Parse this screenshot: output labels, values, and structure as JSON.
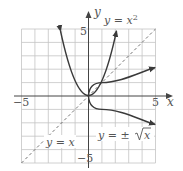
{
  "figure": {
    "x_axis_label": "x",
    "y_axis_label": "y",
    "x_min_tick": "−5",
    "x_max_tick": "5",
    "y_max_tick": "5",
    "y_min_tick": "−5",
    "curves": [
      {
        "name": "parabola",
        "label": "y = x²",
        "style": "solid"
      },
      {
        "name": "sqrt",
        "label": "y = ±√x",
        "style": "solid"
      },
      {
        "name": "identity",
        "label": "y = x",
        "style": "dashed"
      }
    ]
  },
  "labels": {
    "parabola": "y = x",
    "parabola_exp": "2",
    "sqrt_prefix": "y = ±",
    "sqrt_radicand": "x",
    "identity": "y = x"
  },
  "colors": {
    "grid": "#bdbdbd",
    "axis": "#444444",
    "curve": "#3a3a3a",
    "text": "#555555"
  }
}
